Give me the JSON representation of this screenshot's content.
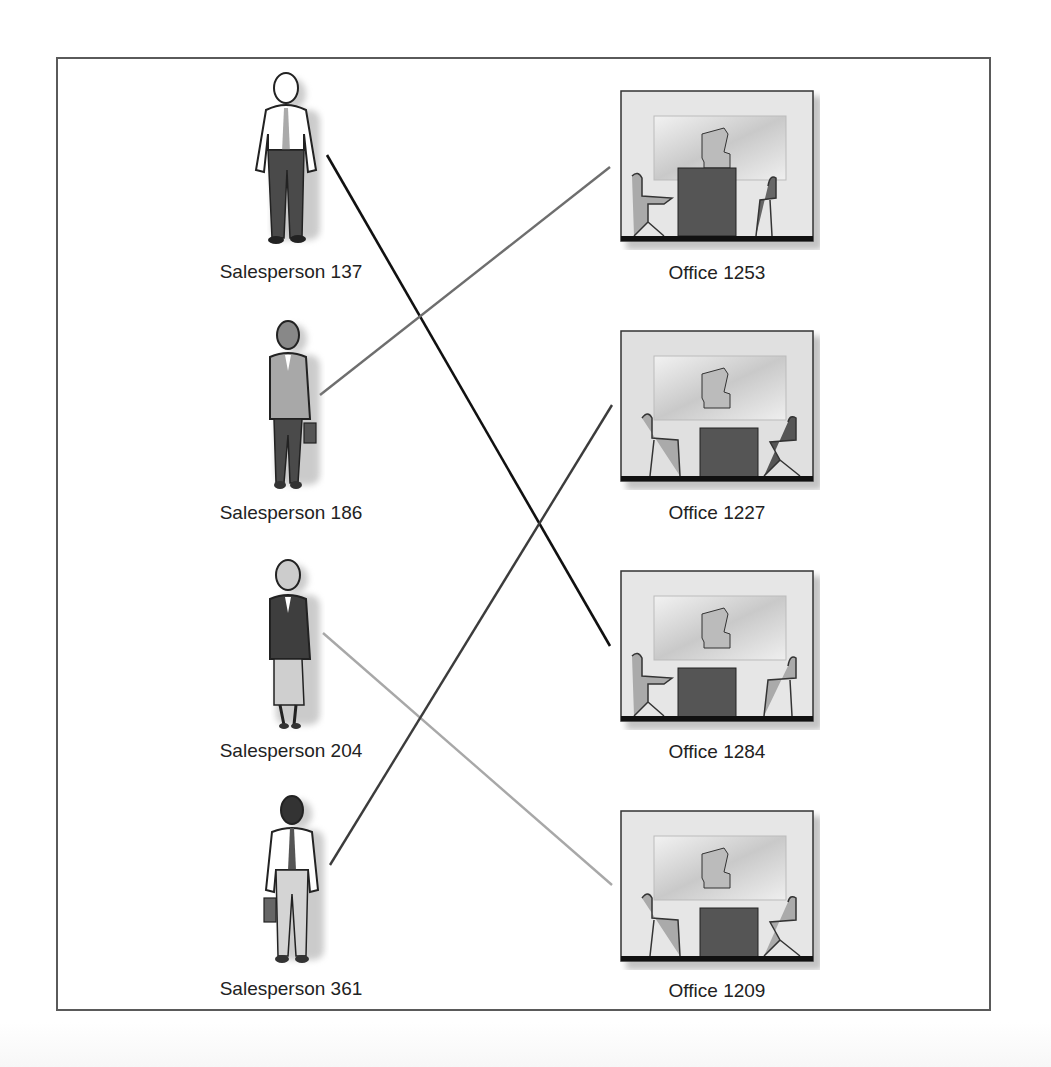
{
  "diagram": {
    "type": "assignment-mapping",
    "salespeople": [
      {
        "id": "137",
        "label": "Salesperson 137",
        "figure": "man-white-shirt-tie-dark-pants"
      },
      {
        "id": "186",
        "label": "Salesperson 186",
        "figure": "woman-gray-suit-briefcase"
      },
      {
        "id": "204",
        "label": "Salesperson 204",
        "figure": "woman-dark-jacket-light-skirt"
      },
      {
        "id": "361",
        "label": "Salesperson 361",
        "figure": "man-white-shirt-tie-briefcase"
      }
    ],
    "offices": [
      {
        "id": "1253",
        "label": "Office 1253"
      },
      {
        "id": "1227",
        "label": "Office 1227"
      },
      {
        "id": "1284",
        "label": "Office 1284"
      },
      {
        "id": "1209",
        "label": "Office 1209"
      }
    ],
    "assignments": [
      {
        "from": "Salesperson 137",
        "to": "Office 1284",
        "color": "#111111"
      },
      {
        "from": "Salesperson 186",
        "to": "Office 1253",
        "color": "#6e6e6e"
      },
      {
        "from": "Salesperson 204",
        "to": "Office 1209",
        "color": "#a8a8a8"
      },
      {
        "from": "Salesperson 361",
        "to": "Office 1227",
        "color": "#3c3c3c"
      }
    ]
  }
}
